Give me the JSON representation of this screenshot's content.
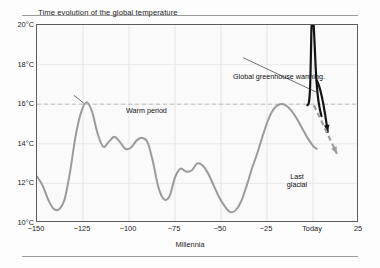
{
  "chart_data": {
    "type": "line",
    "title": "Time evolution of the global temperature",
    "xlabel": "Millennia",
    "ylabel": "",
    "xlim": [
      -150,
      25
    ],
    "ylim": [
      10,
      20
    ],
    "grid": true,
    "legend_position": "none",
    "xticks": [
      -150,
      -125,
      -100,
      -75,
      -50,
      -25,
      0,
      25
    ],
    "xticklabels": [
      "−150",
      "−125",
      "−100",
      "−75",
      "−50",
      "−25",
      "Today",
      "25"
    ],
    "yticks": [
      10,
      12,
      14,
      16,
      18,
      20
    ],
    "yticklabels": [
      "10°C",
      "12°C",
      "14°C",
      "16°C",
      "18°C",
      "20°C"
    ],
    "reference_line": {
      "y": 16,
      "style": "dashed",
      "color": "#b9b9b9"
    },
    "series": [
      {
        "name": "Global temperature record",
        "color": "#9b9b9b",
        "x": [
          -150,
          -147,
          -144,
          -141,
          -138,
          -135,
          -132,
          -129,
          -126,
          -123,
          -120,
          -117,
          -114,
          -111,
          -108,
          -105,
          -102,
          -99,
          -96,
          -93,
          -90,
          -87,
          -84,
          -81,
          -78,
          -75,
          -72,
          -69,
          -66,
          -63,
          -60,
          -57,
          -54,
          -51,
          -48,
          -45,
          -42,
          -39,
          -36,
          -33,
          -30,
          -27,
          -24,
          -21,
          -18,
          -15,
          -12,
          -9,
          -6,
          -3,
          0,
          2
        ],
        "y": [
          12.35,
          11.9,
          11.2,
          10.72,
          10.7,
          11.2,
          12.6,
          14.4,
          15.6,
          16.1,
          15.6,
          14.5,
          13.85,
          14.1,
          14.35,
          14.1,
          13.75,
          13.8,
          14.15,
          14.3,
          14.1,
          13.1,
          11.8,
          11.2,
          11.35,
          12.3,
          12.75,
          12.6,
          12.65,
          13.0,
          12.9,
          12.5,
          11.9,
          11.3,
          10.85,
          10.55,
          10.65,
          11.1,
          11.9,
          12.8,
          13.6,
          14.5,
          15.3,
          15.8,
          16.0,
          15.95,
          15.7,
          15.3,
          14.8,
          14.3,
          13.9,
          13.75
        ]
      },
      {
        "name": "Global greenhouse warming spike",
        "color": "#141414",
        "x": [
          -3.0,
          -2.2,
          -1.6,
          -1.2,
          -0.9,
          -0.6,
          -0.2,
          0.3,
          0.9,
          1.6,
          2.4,
          3.4,
          4.6
        ],
        "y": [
          15.95,
          16.1,
          16.8,
          18.2,
          19.6,
          20.3,
          20.45,
          20.1,
          19.0,
          17.6,
          16.6,
          15.9,
          15.4
        ]
      }
    ],
    "annotations": [
      {
        "name": "warm-period",
        "text": "Warm period",
        "x": -128,
        "y": 16.6
      },
      {
        "name": "global-greenhouse-warming",
        "text": "Global greenhouse warming.",
        "x": -60,
        "y": 18.6
      },
      {
        "name": "last-glacial",
        "text": "Last glacial",
        "lines": [
          "Last",
          "glacial"
        ],
        "x": -27,
        "y": 13.9
      }
    ],
    "arrows": [
      {
        "name": "greenhouse-leader-line",
        "style": "thin-line",
        "color": "#333333",
        "from": [
          -38,
          18.35
        ],
        "to": [
          2.0,
          16.6
        ]
      },
      {
        "name": "warm-period-leader-line",
        "style": "thin-line",
        "color": "#333333",
        "from": [
          -130,
          16.45
        ],
        "to": [
          -124.5,
          16.05
        ]
      },
      {
        "name": "greenhouse-trend-arrow",
        "style": "solid-curved-arrow",
        "color": "#141414",
        "from": [
          2.0,
          17.2
        ],
        "to": [
          8.0,
          14.6
        ]
      },
      {
        "name": "projection-dashed-arrow",
        "style": "dashed-arrow",
        "color": "#9b9b9b",
        "from": [
          0.5,
          15.95
        ],
        "to": [
          13.0,
          13.5
        ]
      }
    ]
  },
  "figure": {
    "title": "Time evolution of the global temperature",
    "xaxis_title": "Millennia"
  }
}
